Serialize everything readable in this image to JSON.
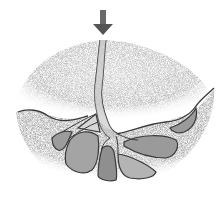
{
  "illustration": {
    "subject": "pencil sketch cross-section of soil with branching tunnels/roots beneath a downward arrow",
    "colors": {
      "background": "#ffffff",
      "soil": "#bdbdbd",
      "soil_dark": "#8a8a8a",
      "chamber": "#a9a9a9",
      "outline": "#3a3a3a",
      "arrow": "#5a5a5a"
    },
    "icons": [
      "down-arrow-icon"
    ]
  }
}
